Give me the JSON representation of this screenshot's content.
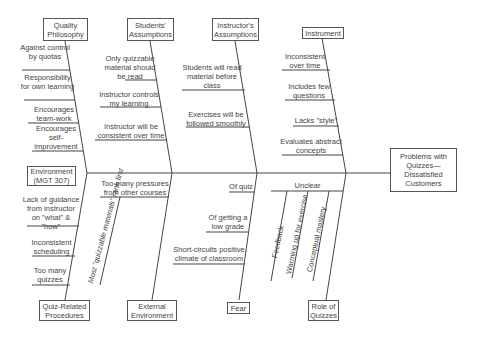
{
  "effect": "Problems with Quizzes—Dissatisfied Customers",
  "categories": {
    "quality_philosophy": {
      "label": "Quality Philosophy",
      "causes": [
        "Against control by quotas",
        "Responsibility for own learning",
        "Encourages team-work",
        "Encourages self-improvement"
      ]
    },
    "students_assumptions": {
      "label": "Students' Assumptions",
      "causes": [
        "Only quizzable material should be read",
        "Instructor controls my learning",
        "Instructor will be consistent over time"
      ]
    },
    "instructors_assumptions": {
      "label": "Instructor's Assumptions",
      "causes": [
        "Students will read material before class",
        "Exercises will be followed smoothly"
      ]
    },
    "instrument": {
      "label": "Instrument",
      "causes": [
        "Inconsistent over time",
        "Includes few questions",
        "Lacks \"style\"",
        "Evaluates abstract concepts"
      ]
    },
    "quiz_related_procedures": {
      "label": "Quiz-Related Procedures",
      "causes": [
        "Environment (MGT 307)",
        "Lack of guidance from instructor on \"what\" & \"how\"",
        "Inconsistent scheduling",
        "Too many quizzes"
      ]
    },
    "external_environment": {
      "label": "External Environment",
      "causes": [
        "Too many pressures from other courses",
        "Most \"quizzable materials\" rank first"
      ]
    },
    "fear": {
      "label": "Fear",
      "causes": [
        "Of quiz",
        "Of getting a low grade",
        "Short-circuits positive climate of classroom"
      ]
    },
    "role_of_quizzes": {
      "label": "Role of Quizzes",
      "causes": [
        "Unclear",
        "Feedback",
        "Warming up for exercise",
        "Conceptual mastery"
      ]
    }
  }
}
